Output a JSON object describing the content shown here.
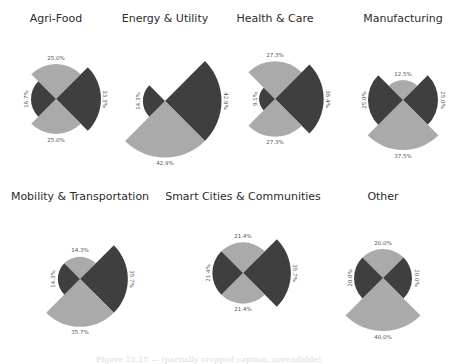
{
  "colors": {
    "dark": "#3f3f3f",
    "light": "#aaaaaa",
    "title": "#2b2b2b",
    "label": "#555555"
  },
  "caption": "Figure 15.15 — (partially cropped caption, unreadable)",
  "chart_data": [
    {
      "type": "polar-area",
      "title": "Agri-Food",
      "center": [
        56,
        99
      ],
      "slices": [
        {
          "direction": "top",
          "value": 25.0,
          "label": "25.0%",
          "color": "light"
        },
        {
          "direction": "right",
          "value": 33.3,
          "label": "33.3%",
          "color": "dark"
        },
        {
          "direction": "bottom",
          "value": 25.0,
          "label": "25.0%",
          "color": "light"
        },
        {
          "direction": "left",
          "value": 16.7,
          "label": "16.7%",
          "color": "dark"
        }
      ]
    },
    {
      "type": "polar-area",
      "title": "Energy & Utility",
      "center": [
        165,
        101
      ],
      "slices": [
        {
          "direction": "top",
          "value": 0.0,
          "label": "",
          "color": "light"
        },
        {
          "direction": "right",
          "value": 42.9,
          "label": "42.9%",
          "color": "dark"
        },
        {
          "direction": "bottom",
          "value": 42.9,
          "label": "42.9%",
          "color": "light"
        },
        {
          "direction": "left",
          "value": 14.3,
          "label": "14.3%",
          "color": "dark"
        }
      ]
    },
    {
      "type": "polar-area",
      "title": "Health & Care",
      "center": [
        275,
        99
      ],
      "slices": [
        {
          "direction": "top",
          "value": 27.3,
          "label": "27.3%",
          "color": "light"
        },
        {
          "direction": "right",
          "value": 36.4,
          "label": "36.4%",
          "color": "dark"
        },
        {
          "direction": "bottom",
          "value": 27.3,
          "label": "27.3%",
          "color": "light"
        },
        {
          "direction": "left",
          "value": 9.1,
          "label": "9.1%",
          "color": "dark"
        }
      ]
    },
    {
      "type": "polar-area",
      "title": "Manufacturing",
      "center": [
        403,
        100
      ],
      "slices": [
        {
          "direction": "top",
          "value": 12.5,
          "label": "12.5%",
          "color": "light"
        },
        {
          "direction": "right",
          "value": 25.0,
          "label": "25.0%",
          "color": "dark"
        },
        {
          "direction": "bottom",
          "value": 37.5,
          "label": "37.5%",
          "color": "light"
        },
        {
          "direction": "left",
          "value": 25.0,
          "label": "25.0%",
          "color": "dark"
        }
      ]
    },
    {
      "type": "polar-area",
      "title": "Mobility & Transportation",
      "center": [
        80,
        279
      ],
      "slices": [
        {
          "direction": "top",
          "value": 14.3,
          "label": "14.3%",
          "color": "light"
        },
        {
          "direction": "right",
          "value": 35.7,
          "label": "35.7%",
          "color": "dark"
        },
        {
          "direction": "bottom",
          "value": 35.7,
          "label": "35.7%",
          "color": "light"
        },
        {
          "direction": "left",
          "value": 14.3,
          "label": "14.3%",
          "color": "dark"
        }
      ]
    },
    {
      "type": "polar-area",
      "title": "Smart Cities & Communities",
      "center": [
        243,
        273
      ],
      "slices": [
        {
          "direction": "top",
          "value": 21.4,
          "label": "21.4%",
          "color": "light"
        },
        {
          "direction": "right",
          "value": 35.7,
          "label": "35.7%",
          "color": "dark"
        },
        {
          "direction": "bottom",
          "value": 21.4,
          "label": "21.4%",
          "color": "light"
        },
        {
          "direction": "left",
          "value": 21.4,
          "label": "21.4%",
          "color": "dark"
        }
      ]
    },
    {
      "type": "polar-area",
      "title": "Other",
      "center": [
        383,
        278
      ],
      "slices": [
        {
          "direction": "top",
          "value": 20.0,
          "label": "20.0%",
          "color": "light"
        },
        {
          "direction": "right",
          "value": 20.0,
          "label": "20.0%",
          "color": "dark"
        },
        {
          "direction": "bottom",
          "value": 40.0,
          "label": "40.0%",
          "color": "light"
        },
        {
          "direction": "left",
          "value": 20.0,
          "label": "20.0%",
          "color": "dark"
        }
      ]
    }
  ],
  "titles_pos": [
    [
      56,
      22
    ],
    [
      165,
      22
    ],
    [
      275,
      22
    ],
    [
      403,
      22
    ],
    [
      80,
      200
    ],
    [
      243,
      200
    ],
    [
      383,
      200
    ]
  ]
}
